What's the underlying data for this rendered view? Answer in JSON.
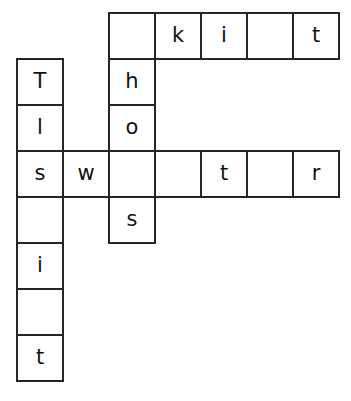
{
  "puzzle": {
    "type": "crossword-grid",
    "background_color": "#ffffff",
    "cell_fill_color": "#ffffff",
    "cell_border_color": "#262626",
    "letter_color": "#111111",
    "cell_size_px": 46,
    "grid_origin": {
      "x": 16,
      "y": 12
    },
    "columns": 7,
    "rows": 8,
    "entries": {
      "across_top": "_ k i _ t",
      "across_middle": "s w _ _ t _ r",
      "down_left": "T l s _ i _ t",
      "down_middle": "_ h o _ s"
    },
    "cells": [
      {
        "id": "c-r0-c2",
        "row": 0,
        "col": 2,
        "letter": "",
        "filled": false
      },
      {
        "id": "c-r0-c3",
        "row": 0,
        "col": 3,
        "letter": "k",
        "filled": true
      },
      {
        "id": "c-r0-c4",
        "row": 0,
        "col": 4,
        "letter": "i",
        "filled": true
      },
      {
        "id": "c-r0-c5",
        "row": 0,
        "col": 5,
        "letter": "",
        "filled": false
      },
      {
        "id": "c-r0-c6",
        "row": 0,
        "col": 6,
        "letter": "t",
        "filled": true
      },
      {
        "id": "c-r1-c0",
        "row": 1,
        "col": 0,
        "letter": "T",
        "filled": true
      },
      {
        "id": "c-r1-c2",
        "row": 1,
        "col": 2,
        "letter": "h",
        "filled": true
      },
      {
        "id": "c-r2-c0",
        "row": 2,
        "col": 0,
        "letter": "l",
        "filled": true
      },
      {
        "id": "c-r2-c2",
        "row": 2,
        "col": 2,
        "letter": "o",
        "filled": true
      },
      {
        "id": "c-r3-c0",
        "row": 3,
        "col": 0,
        "letter": "s",
        "filled": true
      },
      {
        "id": "c-r3-c1",
        "row": 3,
        "col": 1,
        "letter": "w",
        "filled": true
      },
      {
        "id": "c-r3-c2",
        "row": 3,
        "col": 2,
        "letter": "",
        "filled": false
      },
      {
        "id": "c-r3-c3",
        "row": 3,
        "col": 3,
        "letter": "",
        "filled": false
      },
      {
        "id": "c-r3-c4",
        "row": 3,
        "col": 4,
        "letter": "t",
        "filled": true
      },
      {
        "id": "c-r3-c5",
        "row": 3,
        "col": 5,
        "letter": "",
        "filled": false
      },
      {
        "id": "c-r3-c6",
        "row": 3,
        "col": 6,
        "letter": "r",
        "filled": true
      },
      {
        "id": "c-r4-c0",
        "row": 4,
        "col": 0,
        "letter": "",
        "filled": false
      },
      {
        "id": "c-r4-c2",
        "row": 4,
        "col": 2,
        "letter": "s",
        "filled": true
      },
      {
        "id": "c-r5-c0",
        "row": 5,
        "col": 0,
        "letter": "i",
        "filled": true
      },
      {
        "id": "c-r6-c0",
        "row": 6,
        "col": 0,
        "letter": "",
        "filled": false
      },
      {
        "id": "c-r7-c0",
        "row": 7,
        "col": 0,
        "letter": "t",
        "filled": true
      }
    ]
  }
}
